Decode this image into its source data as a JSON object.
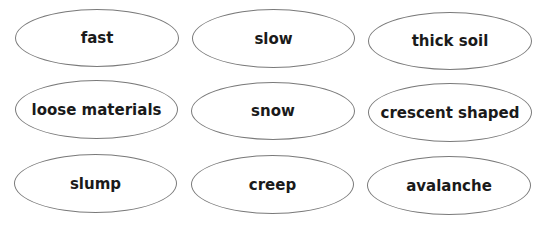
{
  "cards": [
    {
      "label": "fast"
    },
    {
      "label": "slow"
    },
    {
      "label": "thick soil"
    },
    {
      "label": "loose materials"
    },
    {
      "label": "snow"
    },
    {
      "label": "crescent shaped"
    },
    {
      "label": "slump"
    },
    {
      "label": "creep"
    },
    {
      "label": "avalanche"
    }
  ],
  "colors": {
    "outline": "#7a7a7a",
    "text": "#1a1a1a",
    "background": "#ffffff"
  }
}
